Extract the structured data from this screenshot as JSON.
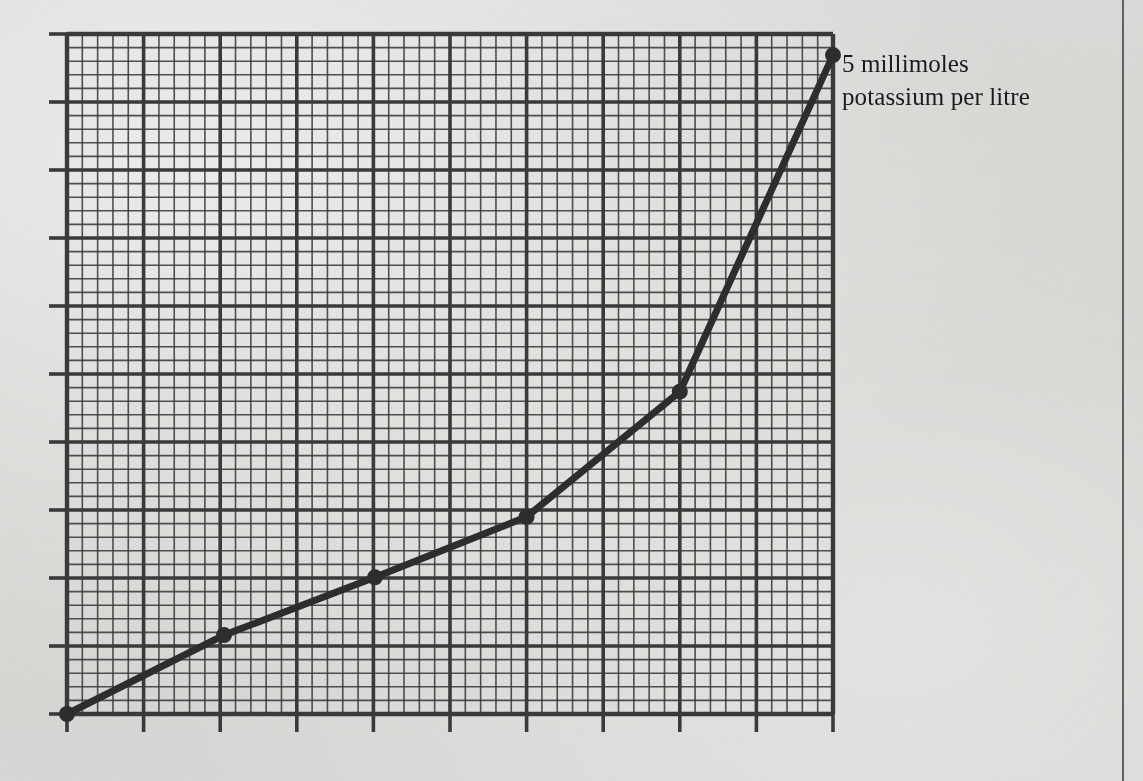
{
  "page": {
    "background_color": "#d8d8d6",
    "ink_color": "#3a3a3a",
    "rule_x": 1122
  },
  "annotation": {
    "text": "5 millimoles\npotassium per litre",
    "line_1": "5 millimoles",
    "line_2": "potassium per litre",
    "x": 842,
    "y": 48,
    "color": "#1b1b1b"
  },
  "chart_data": {
    "type": "line",
    "title": "",
    "subtitle": "",
    "xlabel": "",
    "ylabel": "",
    "annotations": [
      "5 millimoles potassium per litre"
    ],
    "legend": [],
    "legend_position": "none",
    "grid": true,
    "grid_major_divisions_x": 10,
    "grid_major_divisions_y": 10,
    "grid_minor_per_major": 5,
    "xlim": [
      0,
      10
    ],
    "ylim": [
      0,
      10
    ],
    "x_tick_labels": [],
    "y_tick_labels": [],
    "marker": "circle",
    "line_color": "#2d2d2d",
    "line_width": 7,
    "series": [
      {
        "name": "5 millimoles potassium per litre",
        "x": [
          0.0,
          2.05,
          4.02,
          6.0,
          8.0,
          10.0
        ],
        "y": [
          0.0,
          1.16,
          2.01,
          2.9,
          4.74,
          9.69
        ]
      }
    ]
  },
  "plot_geometry": {
    "left": 67,
    "top": 34,
    "width": 766,
    "height": 680,
    "tick_length": 18
  }
}
